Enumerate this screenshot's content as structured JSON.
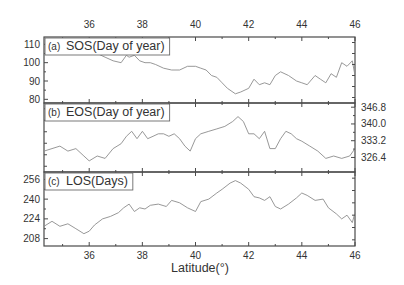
{
  "chart_data": {
    "type": "line",
    "layout": "3 vertically stacked panels sharing x-axis (latitude)",
    "xlabel": "Latitude(°)",
    "xlim": [
      34.3,
      46
    ],
    "xticks": [
      36,
      38,
      40,
      42,
      44,
      46
    ],
    "x_tick_labels_top": [
      "36",
      "38",
      "40",
      "42",
      "44",
      "46"
    ],
    "x_tick_labels_bottom": [
      "36",
      "38",
      "40",
      "42",
      "44",
      "46"
    ],
    "grid": false,
    "line_color": "#8c8c8c",
    "panels": [
      {
        "id": "a",
        "tag": "(a)",
        "title": "SOS(Day of year)",
        "y_axis_side": "left",
        "ylim": [
          78,
          114
        ],
        "yticks": [
          80,
          90,
          100,
          110
        ],
        "ytick_labels": [
          "80",
          "90",
          "100",
          "110"
        ],
        "x": [
          34.3,
          34.6,
          34.9,
          35.2,
          35.5,
          35.8,
          36.0,
          36.1,
          36.3,
          36.6,
          36.9,
          37.2,
          37.4,
          37.5,
          37.7,
          37.9,
          38.1,
          38.3,
          38.5,
          38.8,
          39.1,
          39.4,
          39.7,
          40.0,
          40.2,
          40.4,
          40.6,
          40.8,
          41.0,
          41.2,
          41.5,
          41.7,
          42.0,
          42.2,
          42.4,
          42.6,
          42.8,
          43.0,
          43.2,
          43.5,
          43.8,
          44.0,
          44.2,
          44.5,
          44.7,
          44.9,
          45.1,
          45.3,
          45.5,
          45.7,
          45.9,
          46.0
        ],
        "values": [
          110,
          110,
          108,
          110,
          110,
          110,
          110,
          106,
          105,
          103,
          101,
          100,
          104,
          103,
          104,
          101,
          100,
          100,
          99,
          97,
          96,
          96,
          98,
          98,
          97,
          96,
          93,
          92,
          89,
          86,
          83,
          84,
          86,
          91,
          88,
          89,
          88,
          93,
          95,
          93,
          90,
          89,
          88,
          93,
          91,
          89,
          94,
          92,
          100,
          98,
          101,
          93
        ]
      },
      {
        "id": "b",
        "tag": "(b)",
        "title": "EOS(Day of year)",
        "y_axis_side": "right",
        "ylim": [
          320.5,
          348.5
        ],
        "yticks": [
          326.4,
          333.2,
          340.0,
          346.8
        ],
        "ytick_labels": [
          "326.4",
          "333.2",
          "340.0",
          "346.8"
        ],
        "x": [
          34.3,
          34.6,
          34.9,
          35.2,
          35.5,
          35.8,
          36.0,
          36.3,
          36.6,
          36.9,
          37.2,
          37.4,
          37.6,
          37.8,
          38.0,
          38.2,
          38.4,
          38.6,
          38.8,
          39.0,
          39.2,
          39.4,
          39.6,
          39.8,
          40.0,
          40.2,
          40.5,
          40.8,
          41.1,
          41.4,
          41.6,
          41.8,
          42.0,
          42.2,
          42.4,
          42.6,
          42.8,
          43.0,
          43.2,
          43.4,
          43.6,
          43.8,
          44.0,
          44.3,
          44.6,
          44.9,
          45.2,
          45.5,
          45.8,
          46.0
        ],
        "values": [
          329,
          330,
          331,
          329,
          330,
          327,
          325,
          327,
          326,
          330,
          332,
          335,
          337,
          334,
          337,
          334,
          335,
          336,
          336,
          335,
          336,
          334,
          331,
          329,
          334,
          336,
          337,
          338,
          339,
          341,
          343,
          341,
          336,
          336,
          334,
          337,
          330,
          330,
          334,
          337,
          336,
          334,
          333,
          331,
          329,
          326,
          327,
          326,
          327,
          330
        ]
      },
      {
        "id": "c",
        "tag": "(c)",
        "title": "LOS(Days)",
        "y_axis_side": "left",
        "ylim": [
          202,
          262
        ],
        "yticks": [
          208,
          224,
          240,
          256
        ],
        "ytick_labels": [
          "208",
          "224",
          "240",
          "256"
        ],
        "x": [
          34.3,
          34.6,
          34.9,
          35.2,
          35.5,
          35.8,
          36.0,
          36.2,
          36.5,
          36.8,
          37.1,
          37.3,
          37.5,
          37.7,
          37.9,
          38.1,
          38.3,
          38.6,
          38.9,
          39.1,
          39.4,
          39.7,
          40.0,
          40.2,
          40.5,
          40.8,
          41.0,
          41.3,
          41.5,
          41.7,
          42.0,
          42.2,
          42.4,
          42.6,
          42.8,
          43.0,
          43.2,
          43.5,
          43.8,
          44.0,
          44.2,
          44.5,
          44.8,
          45.0,
          45.3,
          45.5,
          45.7,
          45.9,
          46.0
        ],
        "values": [
          218,
          222,
          218,
          220,
          216,
          212,
          214,
          219,
          224,
          226,
          229,
          233,
          236,
          230,
          233,
          232,
          235,
          236,
          234,
          239,
          237,
          233,
          230,
          238,
          240,
          245,
          248,
          253,
          255,
          253,
          248,
          242,
          241,
          239,
          242,
          234,
          232,
          236,
          241,
          245,
          243,
          239,
          240,
          233,
          228,
          224,
          227,
          221,
          229
        ]
      }
    ]
  }
}
